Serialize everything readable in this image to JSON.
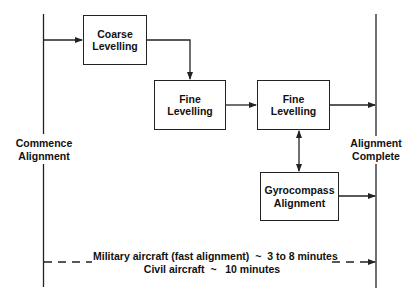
{
  "diagram": {
    "start_label": [
      "Commence",
      "Alignment"
    ],
    "end_label": [
      "Alignment",
      "Complete"
    ],
    "boxes": [
      {
        "id": "coarse",
        "lines": [
          "Coarse",
          "Levelling"
        ]
      },
      {
        "id": "fine1",
        "lines": [
          "Fine",
          "Levelling"
        ]
      },
      {
        "id": "fine2",
        "lines": [
          "Fine",
          "Levelling"
        ]
      },
      {
        "id": "gyro",
        "lines": [
          "Gyrocompass",
          "Alignment"
        ]
      }
    ],
    "timing": {
      "military": "Military aircraft (fast alignment)  ~  3 to 8 minutes",
      "civil": "Civil aircraft  ~   10 minutes"
    },
    "colors": {
      "line": "#222222",
      "text": "#111111",
      "background": "#ffffff"
    }
  }
}
